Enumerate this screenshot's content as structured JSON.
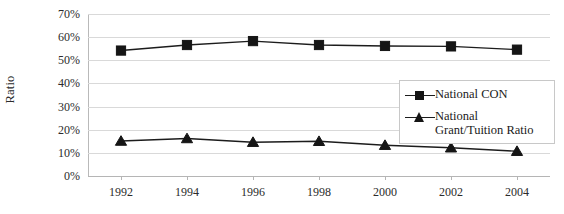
{
  "chart_data": {
    "type": "line",
    "title": "",
    "xlabel": "",
    "ylabel": "Ratio",
    "categories": [
      "1992",
      "1994",
      "1996",
      "1998",
      "2000",
      "2002",
      "2004"
    ],
    "x": [
      1992,
      1994,
      1996,
      1998,
      2000,
      2002,
      2004
    ],
    "ylim": [
      0,
      70
    ],
    "ytick_labels": [
      "0%",
      "10%",
      "20%",
      "30%",
      "40%",
      "50%",
      "60%",
      "70%"
    ],
    "ytick_values": [
      0,
      10,
      20,
      30,
      40,
      50,
      60,
      70
    ],
    "grid": true,
    "legend_position": "right-inside",
    "series": [
      {
        "name": "National CON",
        "marker": "square",
        "color": "#151515",
        "values": [
          54.2,
          56.6,
          58.3,
          56.6,
          56.2,
          56.0,
          54.6
        ]
      },
      {
        "name": "National Grant/Tuition Ratio",
        "marker": "triangle",
        "color": "#151515",
        "values": [
          15.1,
          16.2,
          14.6,
          15.0,
          13.3,
          12.2,
          10.7
        ]
      }
    ]
  },
  "legend": {
    "items": [
      {
        "label": "National CON",
        "marker": "square"
      },
      {
        "label": "National\nGrant/Tuition Ratio",
        "marker": "triangle"
      }
    ]
  },
  "axis": {
    "y_title": "Ratio"
  }
}
